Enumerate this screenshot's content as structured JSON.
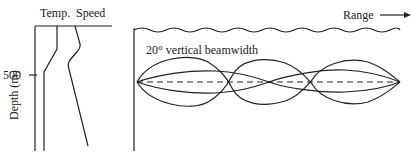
{
  "profile_panel": {
    "column_labels": {
      "temperature": "Temp.",
      "speed": "Speed"
    },
    "depth_tick": "500",
    "depth_axis_label": "Depth (m)"
  },
  "propagation_panel": {
    "range_label": "Range",
    "beam_label": "20° vertical beamwidth"
  },
  "colors": {
    "line": "#222222",
    "background": "#ffffff"
  }
}
